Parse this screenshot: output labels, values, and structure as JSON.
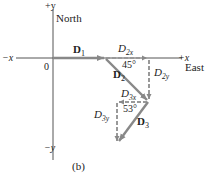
{
  "figure": {
    "panel_label": "(b)",
    "axes": {
      "plus_y": "+y",
      "minus_y": "−y",
      "plus_x": "+x",
      "minus_x": "−x",
      "north": "North",
      "east": "East",
      "origin": "0"
    },
    "vectors": {
      "d1": {
        "label": "D",
        "sub": "1"
      },
      "d2": {
        "label": "D",
        "sub": "2"
      },
      "d3": {
        "label": "D",
        "sub": "3"
      },
      "d2x": {
        "label": "D",
        "sub": "2x"
      },
      "d2y": {
        "label": "D",
        "sub": "2y"
      },
      "d3x": {
        "label": "D",
        "sub": "3x"
      },
      "d3y": {
        "label": "D",
        "sub": "3y"
      }
    },
    "angles": {
      "a45": "45°",
      "a53": "53°"
    },
    "colors": {
      "axis": "#555555",
      "vector": "#8a8a8a",
      "text": "#222222"
    }
  }
}
